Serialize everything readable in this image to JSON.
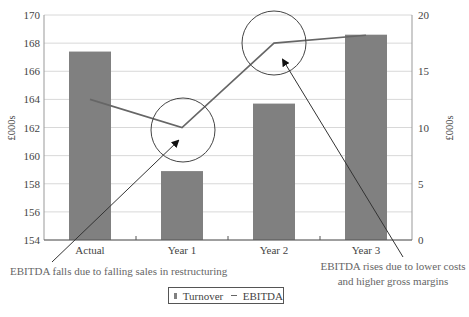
{
  "chart_data": {
    "type": "bar",
    "title": "",
    "categories": [
      "Actual",
      "Year 1",
      "Year 2",
      "Year 3"
    ],
    "series": [
      {
        "name": "Turnover",
        "type": "bar",
        "axis": "left",
        "values": [
          167.4,
          158.9,
          163.7,
          168.6
        ],
        "color": "#808080"
      },
      {
        "name": "EBITDA",
        "type": "line",
        "axis": "right",
        "values": [
          12.5,
          10.0,
          17.5,
          18.2
        ],
        "color": "#666666"
      }
    ],
    "ylabel": "£000s",
    "ylabel_right": "£000s",
    "ylim": [
      154,
      170
    ],
    "ylim_right": [
      0,
      20
    ],
    "yticks": [
      154,
      156,
      158,
      160,
      162,
      164,
      166,
      168,
      170
    ],
    "yticks_right": [
      0,
      5,
      10,
      15,
      20
    ],
    "grid": true,
    "legend_position": "bottom-center",
    "annotations": [
      {
        "text": "EBITDA falls due to falling sales in restructuring",
        "target": "Year 1"
      },
      {
        "text": "EBITDA rises due to lower costs and higher gross margins",
        "target": "Year 2"
      }
    ]
  },
  "annotations": {
    "left": "EBITDA falls due to falling sales in restructuring",
    "right_line1": "EBITDA rises due to lower costs",
    "right_line2": "and higher gross margins"
  },
  "legend": {
    "turnover": "Turnover",
    "ebitda": "EBITDA"
  },
  "axes": {
    "left_label": "£000s",
    "right_label": "£000s"
  }
}
